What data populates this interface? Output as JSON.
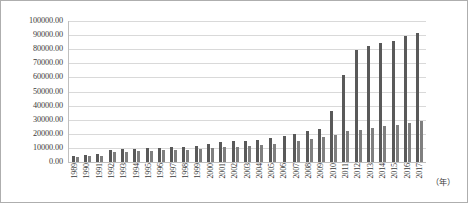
{
  "chart_data": {
    "type": "bar",
    "title": "",
    "subtitle": "",
    "xlabel": "（年）",
    "ylabel": "",
    "grid": true,
    "legend": "none",
    "ylim": [
      0,
      100000
    ],
    "ytick_step": 10000,
    "ytick_labels": [
      "100000.00",
      "90000.00",
      "80000.00",
      "70000.00",
      "60000.00",
      "50000.00",
      "40000.00",
      "30000.00",
      "20000.00",
      "10000.00",
      "0.00"
    ],
    "categories": [
      "1989",
      "1990",
      "1991",
      "1992",
      "1993",
      "1994",
      "1995",
      "1996",
      "1997",
      "1998",
      "1999",
      "2000",
      "2001",
      "2002",
      "2003",
      "2004",
      "2005",
      "2006",
      "2007",
      "2008",
      "2009",
      "2010",
      "2011",
      "2012",
      "2013",
      "2014",
      "2015",
      "2016",
      "2017"
    ],
    "series": [
      {
        "name": "series-1",
        "color": "#595959",
        "values": [
          4600,
          5300,
          5600,
          8500,
          9000,
          9300,
          9600,
          9800,
          10300,
          11000,
          11500,
          12800,
          13900,
          14600,
          14900,
          15800,
          16700,
          18400,
          20200,
          21800,
          23400,
          36000,
          61500,
          79100,
          82400,
          84200,
          86000,
          89200,
          91400
        ]
      },
      {
        "name": "series-2",
        "color": "#7f7f7f",
        "values": [
          3400,
          4200,
          4400,
          6900,
          7400,
          7800,
          8100,
          8300,
          8600,
          8700,
          9000,
          9800,
          10400,
          11000,
          11200,
          12300,
          12700,
          0,
          15200,
          16500,
          17900,
          19200,
          21800,
          22900,
          24000,
          25200,
          26200,
          27800,
          29100
        ]
      }
    ]
  }
}
